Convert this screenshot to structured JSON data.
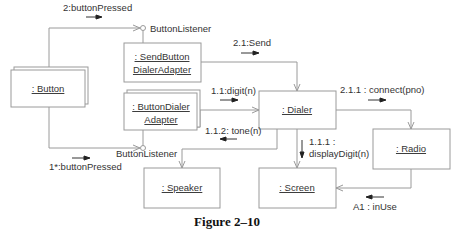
{
  "figure": {
    "caption": "Figure 2–10",
    "type": "UML collaboration diagram"
  },
  "objects": {
    "button": {
      "label": ": Button",
      "multi": true
    },
    "send_adapter": {
      "line1": ": SendButton",
      "line2": "DialerAdapter",
      "multi": false
    },
    "button_adapter": {
      "line1": ": ButtonDialer",
      "line2": "Adapter",
      "multi": true
    },
    "dialer": {
      "label": ": Dialer"
    },
    "radio": {
      "label": ": Radio"
    },
    "speaker": {
      "label": ": Speaker"
    },
    "screen": {
      "label": ": Screen"
    }
  },
  "interfaces": {
    "top": "ButtonListener",
    "bottom": "ButtonListener"
  },
  "messages": {
    "m_button_pressed_top": "2:buttonPressed",
    "m_send": "2.1:Send",
    "m_digit": "1.1:digit(n)",
    "m_tone": "1.1.2: tone(n)",
    "m_connect": "2.1.1 : connect(pno)",
    "m_display_line1": "1.1.1 :",
    "m_display_line2": "displayDigit(n)",
    "m_button_pressed_bottom": "1*:buttonPressed",
    "m_inuse": "A1 : inUse"
  }
}
